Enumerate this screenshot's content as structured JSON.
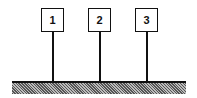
{
  "diagram": {
    "posts": [
      {
        "label": "1"
      },
      {
        "label": "2"
      },
      {
        "label": "3"
      }
    ],
    "ground": "hatched ground surface"
  }
}
